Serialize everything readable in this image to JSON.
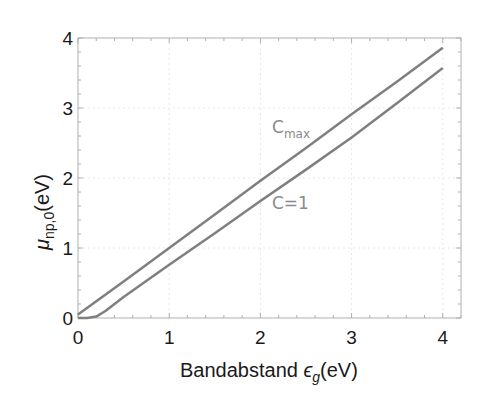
{
  "chart_data": {
    "type": "line",
    "title": "",
    "xlabel": "Bandabstand ε_g(eV)",
    "ylabel": "μ_np,0(eV)",
    "xlim": [
      0,
      4.2
    ],
    "ylim": [
      0,
      4
    ],
    "xticks": [
      0,
      1,
      2,
      3,
      4
    ],
    "yticks": [
      0,
      1,
      2,
      3,
      4
    ],
    "grid": true,
    "legend": "none (inline annotations)",
    "series": [
      {
        "name": "Cmax",
        "color": "#7f7f7f",
        "x": [
          0,
          0.5,
          1,
          1.5,
          2,
          2.5,
          3,
          3.5,
          4
        ],
        "y": [
          0.05,
          0.52,
          1.0,
          1.48,
          1.96,
          2.43,
          2.91,
          3.38,
          3.86
        ]
      },
      {
        "name": "C=1",
        "color": "#7f7f7f",
        "x": [
          0,
          0.1,
          0.2,
          0.3,
          0.5,
          1,
          1.5,
          2,
          2.5,
          3,
          3.5,
          4
        ],
        "y": [
          0.0,
          0.0,
          0.02,
          0.1,
          0.3,
          0.76,
          1.21,
          1.67,
          2.12,
          2.58,
          3.07,
          3.57
        ]
      }
    ],
    "annotations": [
      {
        "text": "C",
        "sub": "max",
        "x": 2.15,
        "y": 2.75
      },
      {
        "text": "C=1",
        "x": 2.15,
        "y": 1.75
      }
    ]
  },
  "labels": {
    "xlabel_main": "Bandabstand ",
    "xlabel_symbol": "ϵ",
    "xlabel_sub": "g",
    "xlabel_unit": "(eV)",
    "ylabel_symbol": "μ",
    "ylabel_sub": "np,0",
    "ylabel_unit": "(eV)",
    "annot_cmax": "C",
    "annot_cmax_sub": "max",
    "annot_c1": "C=1"
  }
}
